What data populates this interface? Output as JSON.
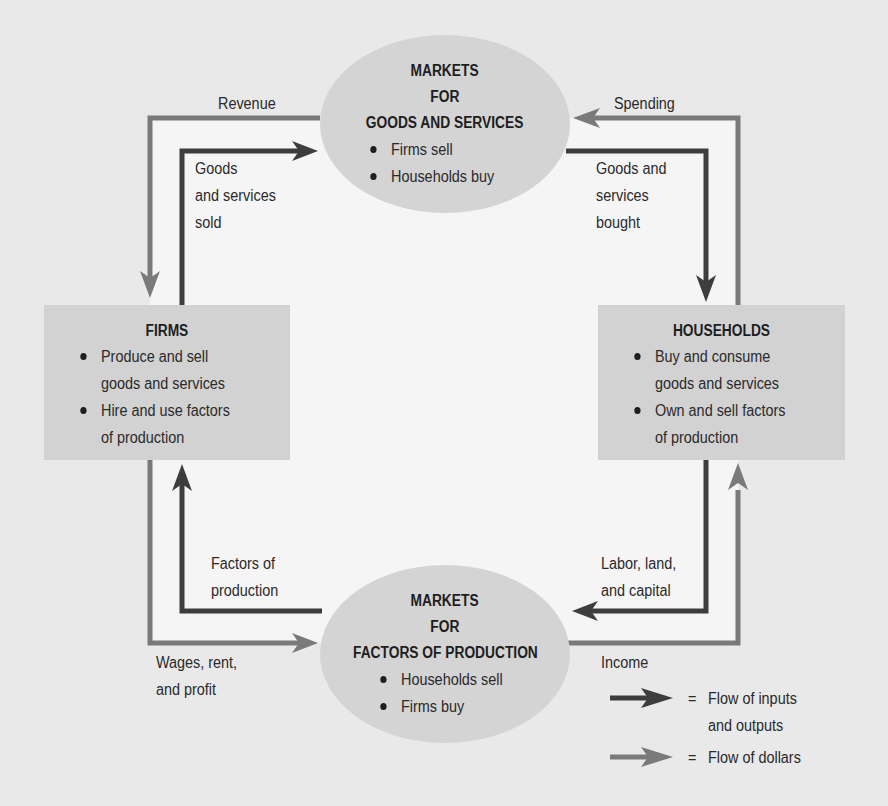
{
  "colors": {
    "background": "#e9e9e9",
    "inner_area": "#f5f5f5",
    "node_fill": "#d3d3d3",
    "flow_inputs_outputs": "#3d3d3d",
    "flow_dollars": "#7a7a7a",
    "text": "#2a2a2a"
  },
  "nodes": {
    "markets_goods": {
      "title_lines": [
        "MARKETS",
        "FOR",
        "GOODS AND SERVICES"
      ],
      "bullets": [
        "Firms sell",
        "Households buy"
      ]
    },
    "markets_factors": {
      "title_lines": [
        "MARKETS",
        "FOR",
        "FACTORS OF PRODUCTION"
      ],
      "bullets": [
        "Households sell",
        "Firms buy"
      ]
    },
    "firms": {
      "title": "FIRMS",
      "bullets": [
        "Produce and sell\ngoods and services",
        "Hire and use factors\nof production"
      ]
    },
    "households": {
      "title": "HOUSEHOLDS",
      "bullets": [
        "Buy and consume\ngoods and services",
        "Own and sell factors\nof production"
      ]
    }
  },
  "flows": {
    "revenue": "Revenue",
    "spending": "Spending",
    "goods_sold": "Goods\nand services\nsold",
    "goods_bought": "Goods and\nservices\nbought",
    "factors_of_production": "Factors of\nproduction",
    "labor_land_capital": "Labor, land,\nand capital",
    "wages_rent_profit": "Wages, rent,\nand profit",
    "income": "Income"
  },
  "legend": {
    "items": [
      {
        "symbol": "dark-arrow",
        "equals": "=",
        "label": "Flow of inputs\nand outputs"
      },
      {
        "symbol": "light-arrow",
        "equals": "=",
        "label": "Flow of dollars"
      }
    ]
  }
}
